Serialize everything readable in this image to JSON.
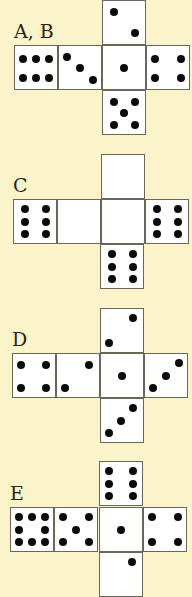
{
  "colors": {
    "background": "#fbf4cb",
    "face": "#ffffff",
    "dot": "#0b0b0b",
    "border": "#6a6658"
  },
  "nets": [
    {
      "label": "A, B",
      "label_pos": [
        14,
        22
      ],
      "faces": [
        {
          "pos": [
            102,
            0
          ],
          "value": 2,
          "dots": [
            [
              0.25,
              0.25
            ],
            [
              0.75,
              0.75
            ]
          ]
        },
        {
          "pos": [
            14,
            45
          ],
          "value": 6,
          "dots": [
            [
              0.2,
              0.3
            ],
            [
              0.5,
              0.3
            ],
            [
              0.8,
              0.3
            ],
            [
              0.2,
              0.75
            ],
            [
              0.5,
              0.75
            ],
            [
              0.8,
              0.75
            ]
          ]
        },
        {
          "pos": [
            58,
            45
          ],
          "value": 3,
          "dots": [
            [
              0.2,
              0.25
            ],
            [
              0.5,
              0.5
            ],
            [
              0.8,
              0.8
            ]
          ]
        },
        {
          "pos": [
            102,
            45
          ],
          "value": 1,
          "dots": [
            [
              0.5,
              0.5
            ]
          ]
        },
        {
          "pos": [
            146,
            45
          ],
          "value": 4,
          "dots": [
            [
              0.2,
              0.3
            ],
            [
              0.8,
              0.3
            ],
            [
              0.2,
              0.75
            ],
            [
              0.8,
              0.75
            ]
          ]
        },
        {
          "pos": [
            102,
            90
          ],
          "value": 5,
          "dots": [
            [
              0.25,
              0.25
            ],
            [
              0.75,
              0.25
            ],
            [
              0.5,
              0.5
            ],
            [
              0.25,
              0.8
            ],
            [
              0.75,
              0.8
            ]
          ]
        }
      ]
    },
    {
      "label": "C",
      "label_pos": [
        13,
        176
      ],
      "faces": [
        {
          "pos": [
            101,
            154
          ],
          "value": 0,
          "dots": []
        },
        {
          "pos": [
            13,
            199
          ],
          "value": 6,
          "dots": [
            [
              0.25,
              0.2
            ],
            [
              0.75,
              0.2
            ],
            [
              0.25,
              0.5
            ],
            [
              0.75,
              0.5
            ],
            [
              0.25,
              0.8
            ],
            [
              0.75,
              0.8
            ]
          ]
        },
        {
          "pos": [
            57,
            199
          ],
          "value": 0,
          "dots": []
        },
        {
          "pos": [
            101,
            199
          ],
          "value": 0,
          "dots": []
        },
        {
          "pos": [
            145,
            199
          ],
          "value": 6,
          "dots": [
            [
              0.25,
              0.2
            ],
            [
              0.75,
              0.2
            ],
            [
              0.25,
              0.5
            ],
            [
              0.75,
              0.5
            ],
            [
              0.25,
              0.8
            ],
            [
              0.75,
              0.8
            ]
          ]
        },
        {
          "pos": [
            100,
            244
          ],
          "value": 6,
          "dots": [
            [
              0.25,
              0.2
            ],
            [
              0.75,
              0.2
            ],
            [
              0.25,
              0.5
            ],
            [
              0.75,
              0.5
            ],
            [
              0.25,
              0.8
            ],
            [
              0.75,
              0.8
            ]
          ]
        }
      ]
    },
    {
      "label": "D",
      "label_pos": [
        12,
        330
      ],
      "faces": [
        {
          "pos": [
            100,
            308
          ],
          "value": 2,
          "dots": [
            [
              0.75,
              0.2
            ],
            [
              0.2,
              0.78
            ]
          ]
        },
        {
          "pos": [
            12,
            353
          ],
          "value": 4,
          "dots": [
            [
              0.2,
              0.25
            ],
            [
              0.78,
              0.25
            ],
            [
              0.2,
              0.78
            ],
            [
              0.78,
              0.78
            ]
          ]
        },
        {
          "pos": [
            56,
            353
          ],
          "value": 2,
          "dots": [
            [
              0.75,
              0.25
            ],
            [
              0.2,
              0.8
            ]
          ]
        },
        {
          "pos": [
            100,
            353
          ],
          "value": 1,
          "dots": [
            [
              0.5,
              0.5
            ]
          ]
        },
        {
          "pos": [
            144,
            353
          ],
          "value": 3,
          "dots": [
            [
              0.8,
              0.2
            ],
            [
              0.5,
              0.5
            ],
            [
              0.2,
              0.8
            ]
          ]
        },
        {
          "pos": [
            100,
            398
          ],
          "value": 3,
          "dots": [
            [
              0.75,
              0.2
            ],
            [
              0.48,
              0.5
            ],
            [
              0.2,
              0.8
            ]
          ]
        }
      ]
    },
    {
      "label": "E",
      "label_pos": [
        10,
        484
      ],
      "faces": [
        {
          "pos": [
            99,
            461
          ],
          "value": 6,
          "dots": [
            [
              0.22,
              0.2
            ],
            [
              0.78,
              0.2
            ],
            [
              0.22,
              0.5
            ],
            [
              0.78,
              0.5
            ],
            [
              0.22,
              0.8
            ],
            [
              0.78,
              0.8
            ]
          ]
        },
        {
          "pos": [
            10,
            507
          ],
          "value": 8,
          "dots": [
            [
              0.2,
              0.2
            ],
            [
              0.5,
              0.2
            ],
            [
              0.8,
              0.2
            ],
            [
              0.2,
              0.5
            ],
            [
              0.8,
              0.5
            ],
            [
              0.2,
              0.8
            ],
            [
              0.5,
              0.8
            ],
            [
              0.8,
              0.8
            ]
          ]
        },
        {
          "pos": [
            54,
            507
          ],
          "value": 5,
          "dots": [
            [
              0.2,
              0.2
            ],
            [
              0.8,
              0.2
            ],
            [
              0.5,
              0.5
            ],
            [
              0.2,
              0.8
            ],
            [
              0.8,
              0.8
            ]
          ]
        },
        {
          "pos": [
            99,
            507
          ],
          "value": 1,
          "dots": [
            [
              0.5,
              0.5
            ]
          ]
        },
        {
          "pos": [
            143,
            507
          ],
          "value": 4,
          "dots": [
            [
              0.2,
              0.22
            ],
            [
              0.8,
              0.22
            ],
            [
              0.2,
              0.78
            ],
            [
              0.8,
              0.78
            ]
          ]
        },
        {
          "pos": [
            99,
            552
          ],
          "value": 1,
          "dots": [
            [
              0.75,
              0.22
            ]
          ]
        }
      ]
    }
  ]
}
